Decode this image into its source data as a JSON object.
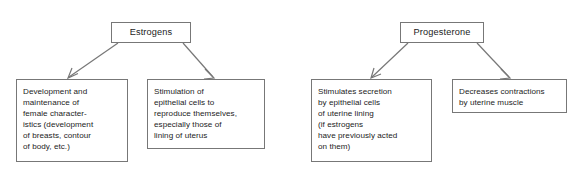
{
  "diagram": {
    "background_color": "#ffffff",
    "border_color": "#777777",
    "text_color": "#1c1c1c",
    "groups": [
      {
        "id": "estrogens",
        "header": {
          "label": "Estrogens"
        },
        "effects": [
          {
            "label": "Development and\nmaintenance of\nfemale character-\nistics (development\nof breasts, contour\nof body, etc.)"
          },
          {
            "label": "Stimulation of\nepithelial cells to\nreproduce themselves,\nespecially those of\nlining of uterus"
          }
        ]
      },
      {
        "id": "progesterone",
        "header": {
          "label": "Progesterone"
        },
        "effects": [
          {
            "label": "Stimulates secretion\nby epithelial cells\nof uterine lining\n(if estrogens\nhave previously acted\non them)"
          },
          {
            "label": "Decreases contractions\nby uterine muscle"
          }
        ]
      }
    ]
  }
}
